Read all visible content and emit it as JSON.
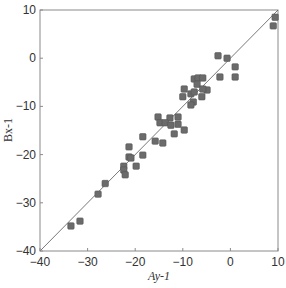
{
  "chart_data": {
    "type": "scatter",
    "title": "",
    "xlabel": "Ay-1",
    "ylabel": "Bx-1",
    "xlim": [
      -40,
      10
    ],
    "ylim": [
      -40,
      10
    ],
    "xticks": [
      -40,
      -30,
      -20,
      -10,
      0,
      10
    ],
    "yticks": [
      -40,
      -30,
      -20,
      -10,
      0,
      10
    ],
    "grid": false,
    "legend": null,
    "reference_line": {
      "label": "y = x",
      "from": [
        -40,
        -40
      ],
      "to": [
        10,
        10
      ]
    },
    "marker": {
      "shape": "square",
      "color": "#6b6b6b",
      "edge": "#555555"
    },
    "series": [
      {
        "name": "data",
        "points": [
          [
            -33.5,
            -34.8
          ],
          [
            -31.6,
            -33.8
          ],
          [
            -27.8,
            -28.2
          ],
          [
            -26.3,
            -26.0
          ],
          [
            -22.4,
            -22.4
          ],
          [
            -22.4,
            -23.2
          ],
          [
            -22.1,
            -24.2
          ],
          [
            -21.3,
            -18.4
          ],
          [
            -21.3,
            -20.5
          ],
          [
            -20.9,
            -20.7
          ],
          [
            -19.8,
            -22.4
          ],
          [
            -18.4,
            -20.1
          ],
          [
            -18.4,
            -16.3
          ],
          [
            -15.8,
            -17.2
          ],
          [
            -14.2,
            -17.6
          ],
          [
            -15.2,
            -12.2
          ],
          [
            -12.7,
            -12.4
          ],
          [
            -11.0,
            -12.2
          ],
          [
            -14.8,
            -13.4
          ],
          [
            -13.7,
            -13.4
          ],
          [
            -12.5,
            -13.9
          ],
          [
            -11.0,
            -13.7
          ],
          [
            -9.7,
            -14.9
          ],
          [
            -11.8,
            -15.7
          ],
          [
            -9.7,
            -6.4
          ],
          [
            -10.0,
            -8.0
          ],
          [
            -8.3,
            -7.4
          ],
          [
            -7.6,
            -7.0
          ],
          [
            -6.0,
            -8.0
          ],
          [
            -7.8,
            -9.1
          ],
          [
            -8.3,
            -9.7
          ],
          [
            -7.6,
            -4.3
          ],
          [
            -6.8,
            -4.1
          ],
          [
            -5.8,
            -4.1
          ],
          [
            -7.0,
            -5.4
          ],
          [
            -4.9,
            -6.6
          ],
          [
            -5.8,
            -6.4
          ],
          [
            -2.6,
            0.5
          ],
          [
            -0.7,
            0.0
          ],
          [
            1.0,
            -1.8
          ],
          [
            1.0,
            -3.9
          ],
          [
            -2.2,
            -3.9
          ],
          [
            9.4,
            8.5
          ],
          [
            9.0,
            6.7
          ]
        ]
      }
    ]
  },
  "axes": {
    "x_label": "Ay-1",
    "y_label": "Bx-1",
    "x_tick_labels": [
      "−40",
      "−30",
      "−20",
      "−10",
      "0",
      "10"
    ],
    "y_tick_labels": [
      "10",
      "0",
      "−10",
      "−20",
      "−30",
      "−40"
    ]
  }
}
